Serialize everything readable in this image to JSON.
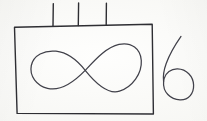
{
  "image": {
    "title": "Hand-drawn sketch",
    "medium": "pen on paper",
    "background_color": "#fbfbf9",
    "ink_color": "#2e2e33",
    "width": 207,
    "height": 121
  },
  "shapes": {
    "rectangle": {
      "name": "rectangle-outline",
      "description": "hand-drawn rectangle frame",
      "stroke_width": "1.4",
      "path": "M14.5 27.2 L152.2 24.2 L153.4 114.0 L17.1 113.4 Z"
    },
    "ticks": {
      "name": "tick-marks",
      "description": "three short vertical strokes above the rectangle",
      "count": 3,
      "stroke_width": "1.4",
      "items": [
        {
          "label": "tick-1",
          "path": "M53.3 3.6 L53.0 26.2"
        },
        {
          "label": "tick-2",
          "path": "M78.6 3.0 L78.3 25.6"
        },
        {
          "label": "tick-3",
          "path": "M106.4 3.2 L106.2 25.1"
        }
      ]
    },
    "infinity": {
      "name": "infinity-symbol",
      "description": "lemniscate drawn inside the rectangle",
      "stroke_width": "1.25",
      "crossing_point": {
        "x": 85,
        "y": 70
      },
      "left_loop_extent": {
        "x_min": 31,
        "y_min": 51,
        "y_max": 89
      },
      "right_loop_extent": {
        "x_max": 141,
        "y_min": 44,
        "y_max": 92
      },
      "path": "M85.2 70.4 C77.0 60.0 68.0 52.5 56.0 51.2 C44.5 50.0 33.5 55.0 31.3 65.5 C29.2 76.0 36.5 85.5 47.5 88.3 C60.5 91.6 73.0 83.0 85.2 70.4 C95.0 60.0 106.5 47.0 119.0 44.4 C131.5 41.8 140.5 48.8 141.3 60.5 C142.1 73.5 132.5 87.0 119.5 91.2 C107.5 95.1 94.5 82.0 85.2 70.4 Z"
    },
    "digit_six": {
      "name": "digit-six-glyph",
      "description": "handwritten numeral six to the right of the rectangle",
      "character": "6",
      "stroke_width": "1.25",
      "bounds": {
        "x_min": 163,
        "x_max": 194,
        "y_min": 36,
        "y_max": 100
      },
      "tail_path": "M181.0 36.4 C175.0 45.0 169.5 54.5 166.2 63.5 C163.4 71.2 163.0 77.0 163.6 81.6",
      "loop_path": "M163.6 81.6 C162.6 92.0 170.5 99.6 180.0 99.9 C189.0 100.2 193.9 93.0 193.6 85.0 C193.2 76.0 186.5 69.2 177.5 68.9 C170.8 68.7 165.8 73.0 164.1 78.6 C163.8 79.6 163.6 80.6 163.6 81.6 Z"
    }
  }
}
